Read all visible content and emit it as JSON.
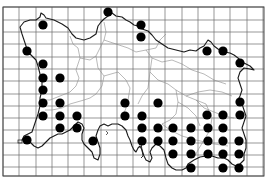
{
  "map": {
    "type": "distribution-dot-map",
    "description": "Grid square distribution map of an island with occurrence dots",
    "frame": {
      "x": 3,
      "y": 7,
      "width": 261,
      "height": 169
    },
    "grid": {
      "columns": 16,
      "vertical_lines_x": [
        3,
        19,
        36,
        52,
        68,
        84,
        101,
        117,
        133,
        149,
        165,
        182,
        198,
        214,
        230,
        247,
        263
      ],
      "horizontal_lines_y": [
        7,
        20,
        32,
        44,
        57,
        69,
        81,
        94,
        106,
        118,
        130,
        143,
        155,
        167,
        176
      ]
    },
    "colors": {
      "dot": "#000000",
      "coast": "#1a1a1a",
      "grid": "#6a6a6a",
      "parish": "#8a8a8a",
      "background": "#ffffff"
    },
    "dot_radius": 4.6,
    "dots": [
      [
        108,
        12
      ],
      [
        43,
        25
      ],
      [
        141,
        25
      ],
      [
        141,
        37
      ],
      [
        27,
        51
      ],
      [
        207,
        51
      ],
      [
        223,
        51
      ],
      [
        240,
        63
      ],
      [
        43,
        64
      ],
      [
        43,
        78
      ],
      [
        60,
        78
      ],
      [
        43,
        90
      ],
      [
        43,
        103
      ],
      [
        60,
        103
      ],
      [
        125,
        103
      ],
      [
        158,
        103
      ],
      [
        240,
        102
      ],
      [
        43,
        116
      ],
      [
        60,
        116
      ],
      [
        77,
        116
      ],
      [
        125,
        116
      ],
      [
        142,
        116
      ],
      [
        207,
        115
      ],
      [
        223,
        115
      ],
      [
        240,
        115
      ],
      [
        60,
        128
      ],
      [
        77,
        128
      ],
      [
        142,
        128
      ],
      [
        158,
        128
      ],
      [
        173,
        128
      ],
      [
        191,
        128
      ],
      [
        208,
        128
      ],
      [
        223,
        128
      ],
      [
        27,
        140
      ],
      [
        93,
        141
      ],
      [
        142,
        141
      ],
      [
        158,
        141
      ],
      [
        173,
        141
      ],
      [
        191,
        141
      ],
      [
        208,
        141
      ],
      [
        223,
        141
      ],
      [
        239,
        141
      ],
      [
        173,
        154
      ],
      [
        191,
        154
      ],
      [
        208,
        154
      ],
      [
        223,
        154
      ],
      [
        239,
        154
      ],
      [
        191,
        168
      ],
      [
        223,
        168
      ],
      [
        239,
        168
      ]
    ]
  }
}
